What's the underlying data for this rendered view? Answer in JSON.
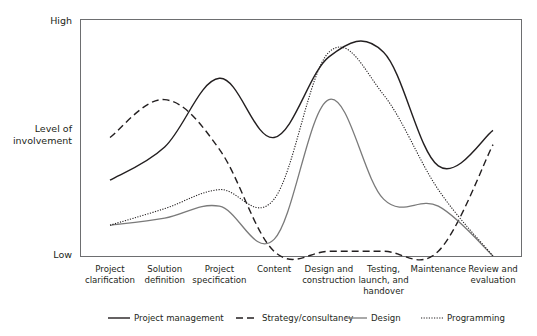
{
  "chart_data": {
    "type": "line",
    "title": "",
    "xlabel": "",
    "ylabel": "Level of involvement",
    "y_tick_labels": [
      "Low",
      "Level of involvement",
      "High"
    ],
    "ylim": [
      0,
      100
    ],
    "grid": false,
    "categories": [
      [
        "Project",
        "clarification"
      ],
      [
        "Solution",
        "definition"
      ],
      [
        "Project",
        "specification"
      ],
      [
        "Content"
      ],
      [
        "Design and",
        "construction"
      ],
      [
        "Testing,",
        "launch, and",
        "handover"
      ],
      [
        "Maintenance"
      ],
      [
        "Review and",
        "evaluation"
      ]
    ],
    "series": [
      {
        "name": "Project management",
        "style": "solid",
        "color": "#231f20",
        "values": [
          32,
          46,
          75,
          50,
          84,
          86,
          38,
          53
        ]
      },
      {
        "name": "Strategy/consultancy",
        "style": "dashed",
        "color": "#231f20",
        "values": [
          50,
          66,
          45,
          2,
          2,
          2,
          2,
          47
        ]
      },
      {
        "name": "Design",
        "style": "solid-gray",
        "color": "#7a7a7a",
        "values": [
          13,
          16,
          21,
          7,
          66,
          24,
          21,
          0
        ]
      },
      {
        "name": "Programming",
        "style": "dotted",
        "color": "#231f20",
        "values": [
          13,
          20,
          28,
          24,
          86,
          68,
          28,
          0
        ]
      }
    ],
    "legend_position": "bottom"
  }
}
